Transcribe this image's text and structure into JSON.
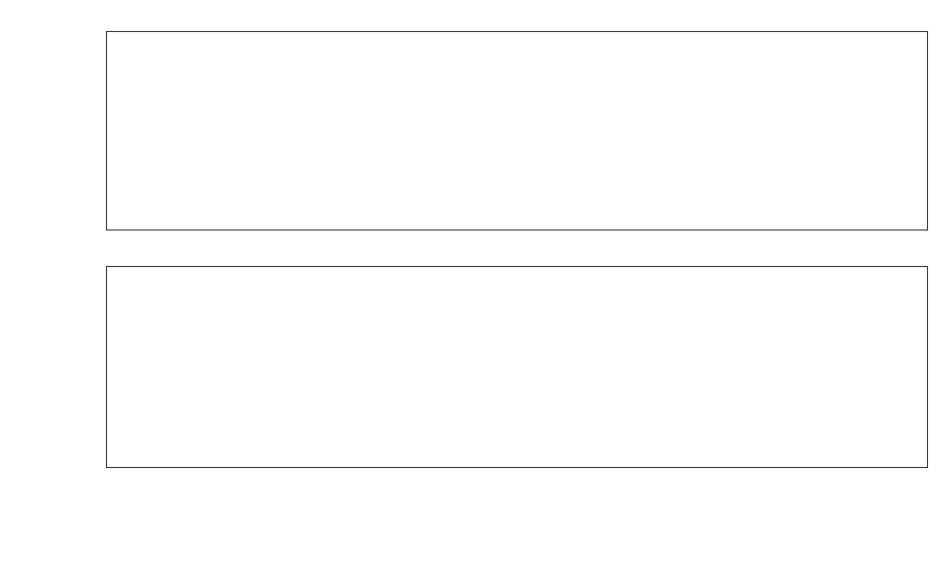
{
  "figure": {
    "width": 951,
    "height": 572,
    "background": "#ffffff",
    "foreground": "#141414"
  },
  "chart_data": [
    {
      "id": "att-panel",
      "type": "line",
      "title": "",
      "xlabel": "",
      "ylabel": "ATT",
      "ylim": [
        -0.0035,
        0.0455
      ],
      "yticks": [
        0.0,
        0.01,
        0.02,
        0.03,
        0.04
      ],
      "yticklabels": [
        "0.00",
        "0.01",
        "0.02",
        "0.03",
        "0.04"
      ],
      "xlim": [
        "2022-02-24",
        "2022-07-03"
      ],
      "xticks": [
        "2022-03-01",
        "2022-03-15",
        "2022-04-01",
        "2022-04-15",
        "2022-05-01",
        "2022-05-15",
        "2022-06-01",
        "2022-06-15",
        "2022-07-01"
      ],
      "xticklabels": [
        "2022-03-01",
        "2022-03-15",
        "2022-04-01",
        "2022-04-15",
        "2022-05-01",
        "2022-05-15",
        "2022-06-01",
        "2022-06-15",
        "2022-07-01"
      ],
      "grid": false,
      "legend_position": "upper left",
      "legend": [
        "Synthetic Control",
        "Treated",
        "T0"
      ],
      "annotations": [
        {
          "name": "treatment-line",
          "label": "T0",
          "x": "2022-04-30",
          "style": "dashed"
        }
      ],
      "x": [
        "2022-03-01",
        "2022-03-02",
        "2022-03-03",
        "2022-03-04",
        "2022-03-05",
        "2022-03-06",
        "2022-03-07",
        "2022-03-08",
        "2022-03-09",
        "2022-03-10",
        "2022-03-11",
        "2022-03-12",
        "2022-03-13",
        "2022-03-14",
        "2022-03-15",
        "2022-03-16",
        "2022-03-17",
        "2022-03-18",
        "2022-03-19",
        "2022-03-20",
        "2022-03-21",
        "2022-03-22",
        "2022-03-23",
        "2022-03-24",
        "2022-03-25",
        "2022-03-26",
        "2022-03-27",
        "2022-03-28",
        "2022-03-29",
        "2022-03-30",
        "2022-03-31",
        "2022-04-01",
        "2022-04-02",
        "2022-04-03",
        "2022-04-04",
        "2022-04-05",
        "2022-04-06",
        "2022-04-07",
        "2022-04-08",
        "2022-04-09",
        "2022-04-10",
        "2022-04-11",
        "2022-04-12",
        "2022-04-13",
        "2022-04-14",
        "2022-04-15",
        "2022-04-16",
        "2022-04-17",
        "2022-04-18",
        "2022-04-19",
        "2022-04-20",
        "2022-04-21",
        "2022-04-22",
        "2022-04-23",
        "2022-04-24",
        "2022-04-25",
        "2022-04-26",
        "2022-04-27",
        "2022-04-28",
        "2022-04-29",
        "2022-04-30",
        "2022-05-01",
        "2022-05-02",
        "2022-05-03",
        "2022-05-04",
        "2022-05-05",
        "2022-05-06",
        "2022-05-07",
        "2022-05-08",
        "2022-05-09",
        "2022-05-10",
        "2022-05-11",
        "2022-05-12",
        "2022-05-13",
        "2022-05-14",
        "2022-05-15",
        "2022-05-16",
        "2022-05-17",
        "2022-05-18",
        "2022-05-19",
        "2022-05-20",
        "2022-05-21",
        "2022-05-22",
        "2022-05-23",
        "2022-05-24",
        "2022-05-25",
        "2022-05-26",
        "2022-05-27",
        "2022-05-28",
        "2022-05-29",
        "2022-05-30",
        "2022-05-31",
        "2022-06-01",
        "2022-06-02",
        "2022-06-03",
        "2022-06-04",
        "2022-06-05",
        "2022-06-06",
        "2022-06-07",
        "2022-06-08",
        "2022-06-09",
        "2022-06-10",
        "2022-06-11",
        "2022-06-12",
        "2022-06-13",
        "2022-06-14",
        "2022-06-15",
        "2022-06-16",
        "2022-06-17",
        "2022-06-18",
        "2022-06-19",
        "2022-06-20",
        "2022-06-21",
        "2022-06-22",
        "2022-06-23",
        "2022-06-24",
        "2022-06-25",
        "2022-06-26",
        "2022-06-27"
      ],
      "series": [
        {
          "name": "Synthetic Control",
          "style": "solid",
          "color": "#141414",
          "values": [
            0.0167,
            0.016,
            0.0133,
            0.011,
            0.0091,
            0.0074,
            0.0065,
            0.009,
            0.0135,
            0.0196,
            0.0155,
            0.012,
            0.0098,
            0.0087,
            0.0082,
            0.0097,
            0.0074,
            0.006,
            0.0046,
            0.0078,
            0.012,
            0.0175,
            0.0168,
            0.0143,
            0.0121,
            0.0114,
            0.0103,
            0.0094,
            0.0128,
            0.0172,
            0.0215,
            0.021,
            0.018,
            0.0152,
            0.0127,
            0.0109,
            0.0097,
            0.0134,
            0.0183,
            0.0222,
            0.0218,
            0.02,
            0.0161,
            0.0126,
            0.01,
            0.0083,
            0.0073,
            0.0107,
            0.0151,
            0.0194,
            0.018,
            0.0161,
            0.0142,
            0.0126,
            0.0117,
            0.01,
            0.0086,
            0.0112,
            0.0161,
            0.0178,
            0.0164,
            0.0155,
            0.0148,
            0.0124,
            0.01,
            0.0089,
            0.0107,
            0.0147,
            0.0195,
            0.0245,
            0.023,
            0.02,
            0.0172,
            0.0154,
            0.0145,
            0.0129,
            0.0117,
            0.0155,
            0.0205,
            0.0248,
            0.0232,
            0.0201,
            0.0178,
            0.0156,
            0.014,
            0.0147,
            0.0183,
            0.0214,
            0.0207,
            0.0182,
            0.016,
            0.0143,
            0.0132,
            0.0121,
            0.0115,
            0.0157,
            0.02,
            0.0241,
            0.0228,
            0.0198,
            0.0158,
            0.012,
            0.0094,
            0.0078,
            0.009,
            0.0122,
            0.0168,
            0.0213,
            0.0206,
            0.0183,
            0.0153,
            0.0129,
            0.0114,
            0.0102,
            0.014,
            0.0184,
            0.0223,
            0.0232,
            0.0258,
            0.0244,
            0.0232
          ],
          "linewidth": 2.0
        },
        {
          "name": "Treated",
          "style": "dashdot",
          "color": "#232323",
          "values": [
            0.017,
            0.0162,
            0.0131,
            0.0107,
            0.0088,
            0.0071,
            0.0071,
            0.0095,
            0.0135,
            0.0194,
            0.0152,
            0.0118,
            0.0096,
            0.0089,
            0.009,
            0.0093,
            0.0072,
            0.0058,
            0.0046,
            0.0079,
            0.0122,
            0.0172,
            0.0161,
            0.0132,
            0.0117,
            0.011,
            0.0104,
            0.0097,
            0.0131,
            0.0175,
            0.0218,
            0.0213,
            0.0182,
            0.015,
            0.0124,
            0.0107,
            0.0098,
            0.0137,
            0.0185,
            0.0225,
            0.0248,
            0.0265,
            0.0232,
            0.0128,
            0.0099,
            0.0082,
            0.0073,
            0.0107,
            0.015,
            0.0191,
            0.0178,
            0.0159,
            0.014,
            0.0122,
            0.0112,
            0.0097,
            0.0086,
            0.011,
            0.0158,
            0.0194,
            0.017,
            0.0148,
            0.0143,
            0.012,
            0.0098,
            0.009,
            0.0112,
            0.0155,
            0.0208,
            0.0268,
            0.0248,
            0.0212,
            0.0182,
            0.0163,
            0.0152,
            0.0134,
            0.0122,
            0.0162,
            0.0217,
            0.0263,
            0.0246,
            0.0216,
            0.0193,
            0.017,
            0.0152,
            0.016,
            0.02,
            0.0238,
            0.023,
            0.0206,
            0.018,
            0.016,
            0.0147,
            0.0135,
            0.0128,
            0.0174,
            0.0225,
            0.0272,
            0.0258,
            0.0224,
            0.0178,
            0.0135,
            0.0105,
            0.0086,
            0.01,
            0.0136,
            0.0188,
            0.0238,
            0.023,
            0.0205,
            0.0171,
            0.0143,
            0.0126,
            0.0112,
            0.0153,
            0.0202,
            0.0246,
            0.0258,
            0.0286,
            0.027,
            0.0256
          ],
          "linewidth": 1.8
        }
      ]
    },
    {
      "id": "effect-panel",
      "type": "line",
      "title": "",
      "xlabel": "",
      "ylabel": "app_download_pct",
      "ylim": [
        -0.0122,
        0.0175
      ],
      "yticks": [
        -0.01,
        0.0,
        0.01
      ],
      "yticklabels": [
        "-0.01",
        "0.00",
        "0.01"
      ],
      "xlim": [
        "2022-02-24",
        "2022-07-03"
      ],
      "xticks": [
        "2022-03-01",
        "2022-03-15",
        "2022-04-01",
        "2022-04-15",
        "2022-05-01",
        "2022-05-15",
        "2022-06-01",
        "2022-06-15",
        "2022-07-01"
      ],
      "xticklabels": [
        "2022-03-01",
        "2022-03-15",
        "2022-04-01",
        "2022-04-15",
        "2022-05-01",
        "2022-05-15",
        "2022-06-01",
        "2022-06-15",
        "2022-07-01"
      ],
      "grid": false,
      "legend_position": "upper right",
      "legend": [
        "Effect",
        "T0"
      ],
      "annotations": [
        {
          "name": "treatment-line",
          "label": "T0",
          "x": "2022-04-30",
          "style": "solid"
        },
        {
          "name": "zero-line",
          "label": "",
          "y": 0.0,
          "style": "solid"
        }
      ],
      "x": [
        "2022-03-01",
        "2022-03-02",
        "2022-03-03",
        "2022-03-04",
        "2022-03-05",
        "2022-03-06",
        "2022-03-07",
        "2022-03-08",
        "2022-03-09",
        "2022-03-10",
        "2022-03-11",
        "2022-03-12",
        "2022-03-13",
        "2022-03-14",
        "2022-03-15",
        "2022-03-16",
        "2022-03-17",
        "2022-03-18",
        "2022-03-19",
        "2022-03-20",
        "2022-03-21",
        "2022-03-22",
        "2022-03-23",
        "2022-03-24",
        "2022-03-25",
        "2022-03-26",
        "2022-03-27",
        "2022-03-28",
        "2022-03-29",
        "2022-03-30",
        "2022-03-31",
        "2022-04-01",
        "2022-04-02",
        "2022-04-03",
        "2022-04-04",
        "2022-04-05",
        "2022-04-06",
        "2022-04-07",
        "2022-04-08",
        "2022-04-09",
        "2022-04-10",
        "2022-04-11",
        "2022-04-12",
        "2022-04-13",
        "2022-04-14",
        "2022-04-15",
        "2022-04-16",
        "2022-04-17",
        "2022-04-18",
        "2022-04-19",
        "2022-04-20",
        "2022-04-21",
        "2022-04-22",
        "2022-04-23",
        "2022-04-24",
        "2022-04-25",
        "2022-04-26",
        "2022-04-27",
        "2022-04-28",
        "2022-04-29",
        "2022-04-30",
        "2022-05-01",
        "2022-05-02",
        "2022-05-03",
        "2022-05-04",
        "2022-05-05",
        "2022-05-06",
        "2022-05-07",
        "2022-05-08",
        "2022-05-09",
        "2022-05-10",
        "2022-05-11",
        "2022-05-12",
        "2022-05-13",
        "2022-05-14",
        "2022-05-15",
        "2022-05-16",
        "2022-05-17",
        "2022-05-18",
        "2022-05-19",
        "2022-05-20",
        "2022-05-21",
        "2022-05-22",
        "2022-05-23",
        "2022-05-24",
        "2022-05-25",
        "2022-05-26",
        "2022-05-27",
        "2022-05-28",
        "2022-05-29",
        "2022-05-30",
        "2022-05-31",
        "2022-06-01",
        "2022-06-02",
        "2022-06-03",
        "2022-06-04",
        "2022-06-05",
        "2022-06-06",
        "2022-06-07",
        "2022-06-08",
        "2022-06-09",
        "2022-06-10",
        "2022-06-11",
        "2022-06-12",
        "2022-06-13",
        "2022-06-14",
        "2022-06-15",
        "2022-06-16",
        "2022-06-17",
        "2022-06-18",
        "2022-06-19",
        "2022-06-20",
        "2022-06-21",
        "2022-06-22",
        "2022-06-23",
        "2022-06-24",
        "2022-06-25",
        "2022-06-26",
        "2022-06-27"
      ],
      "series": [
        {
          "name": "Effect",
          "style": "dashdot",
          "color": "#232323",
          "values": [
            0.0003,
            0.0002,
            -0.0002,
            -0.0003,
            -0.0003,
            -0.0003,
            0.0006,
            0.0005,
            0.0,
            -0.0002,
            -0.0003,
            -0.0002,
            -0.0002,
            0.0002,
            0.0008,
            -0.0004,
            -0.0002,
            -0.0002,
            0.0,
            0.0001,
            0.0002,
            -0.0003,
            -0.0007,
            -0.0011,
            -0.0004,
            -0.0004,
            0.0001,
            0.0003,
            0.0003,
            0.0003,
            0.0003,
            0.0003,
            0.0002,
            -0.0002,
            -0.0003,
            -0.0002,
            0.0001,
            0.0003,
            0.0002,
            0.0003,
            0.003,
            0.0065,
            0.0071,
            0.0002,
            -0.0001,
            -0.0001,
            0.0,
            0.0,
            -0.0001,
            -0.0003,
            -0.0002,
            -0.0002,
            -0.0002,
            -0.0004,
            -0.0005,
            -0.0003,
            0.0,
            -0.0002,
            -0.0003,
            0.0016,
            0.0006,
            -0.0007,
            -0.0005,
            -0.0004,
            -0.0002,
            0.0001,
            0.0005,
            0.0008,
            0.0013,
            0.0023,
            0.0018,
            0.0012,
            0.001,
            0.0009,
            0.0007,
            0.0005,
            0.0005,
            0.0007,
            0.0012,
            0.0015,
            0.0014,
            0.0015,
            0.0014,
            0.0012,
            0.0013,
            0.0017,
            0.0024,
            0.0023,
            0.0024,
            0.002,
            0.0017,
            0.0015,
            0.0014,
            0.0013,
            0.0017,
            0.0025,
            0.0031,
            0.003,
            0.0026,
            0.002,
            0.0015,
            0.0011,
            0.0008,
            0.001,
            0.0014,
            0.002,
            0.0025,
            0.0024,
            0.0022,
            0.0018,
            0.0014,
            0.0012,
            0.001,
            0.0013,
            0.0018,
            0.0023,
            0.0026,
            0.0028,
            0.0026,
            0.0024
          ],
          "linewidth": 1.8
        }
      ]
    }
  ],
  "panels": {
    "top": {
      "ylabel": "ATT",
      "yticklabels": [
        "0.04",
        "0.03",
        "0.02",
        "0.01",
        "0.00"
      ],
      "legend": [
        {
          "label": "Synthetic Control",
          "style": "solid"
        },
        {
          "label": "Treated",
          "style": "dashdot"
        },
        {
          "label": "T",
          "sub": "0",
          "style": "dashed",
          "italic": true
        }
      ]
    },
    "bottom": {
      "ylabel": "app_download_pct",
      "yticklabels": [
        "0.01",
        "0.00",
        "-0.01"
      ],
      "legend": [
        {
          "label": "Effect",
          "style": "dashdot"
        },
        {
          "label": "T",
          "sub": "0",
          "style": "solid",
          "italic": true
        }
      ]
    },
    "xticklabels": [
      "2022-03-01",
      "2022-03-15",
      "2022-04-01",
      "2022-04-15",
      "2022-05-01",
      "2022-05-15",
      "2022-06-01",
      "2022-06-15",
      "2022-07-01"
    ]
  }
}
